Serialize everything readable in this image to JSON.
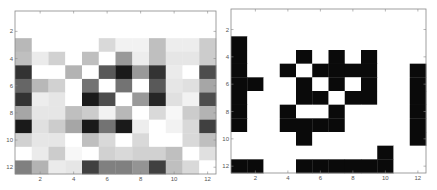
{
  "chart_data": [
    {
      "type": "heatmap",
      "title": "",
      "colormap": "gray",
      "value_meaning": "lightness 0 (black) to 1 (white)",
      "xlabel": "",
      "ylabel": "",
      "xlim": [
        0.5,
        12.5
      ],
      "ylim": [
        0.5,
        12.5
      ],
      "x_ticks": [
        2,
        4,
        6,
        8,
        10,
        12
      ],
      "y_ticks": [
        2,
        4,
        6,
        8,
        10,
        12
      ],
      "y_reversed": true,
      "grid": false,
      "rows": [
        [
          1,
          1,
          1,
          1,
          1,
          1,
          1,
          1,
          1,
          1,
          1,
          1
        ],
        [
          1,
          1,
          1,
          1,
          1,
          1,
          1,
          1,
          1,
          1,
          1,
          1
        ],
        [
          0.72,
          1,
          1,
          1,
          1,
          0.85,
          0.95,
          0.95,
          0.75,
          0.93,
          0.93,
          0.8
        ],
        [
          0.75,
          0.92,
          0.82,
          1,
          0.75,
          1,
          0.6,
          0.93,
          0.75,
          0.9,
          0.9,
          0.8
        ],
        [
          0.2,
          1,
          1,
          0.7,
          1,
          0.35,
          0.1,
          0.6,
          0.2,
          0.92,
          1,
          0.3
        ],
        [
          0.4,
          0.72,
          0.82,
          1,
          0.45,
          1,
          0.45,
          1,
          0.35,
          0.9,
          0.88,
          0.65
        ],
        [
          0.2,
          0.93,
          0.9,
          1,
          0.1,
          0.3,
          1,
          0.6,
          0.15,
          0.88,
          0.95,
          0.3
        ],
        [
          0.65,
          0.9,
          0.9,
          0.75,
          0.8,
          0.95,
          0.72,
          1,
          0.85,
          0.97,
          0.8,
          0.7
        ],
        [
          0.1,
          0.88,
          0.8,
          0.65,
          0.1,
          0.45,
          0.1,
          0.93,
          1,
          0.95,
          0.85,
          0.25
        ],
        [
          0.82,
          0.9,
          0.9,
          1,
          0.75,
          0.85,
          1,
          0.85,
          1,
          1,
          0.85,
          0.75
        ],
        [
          1,
          0.92,
          0.8,
          0.97,
          1,
          0.82,
          0.85,
          0.82,
          0.82,
          0.75,
          1,
          0.88
        ],
        [
          0.5,
          0.7,
          0.92,
          0.9,
          0.25,
          0.5,
          0.5,
          0.58,
          0.25,
          0.75,
          0.85,
          1
        ]
      ]
    },
    {
      "type": "heatmap",
      "title": "",
      "colormap": "binary",
      "value_meaning": "1 = black cell, 0 = white cell",
      "xlabel": "",
      "ylabel": "",
      "xlim": [
        0.5,
        12.5
      ],
      "ylim": [
        0.5,
        12.5
      ],
      "x_ticks": [
        2,
        4,
        6,
        8,
        10,
        12
      ],
      "y_ticks": [
        2,
        4,
        6,
        8,
        10,
        12
      ],
      "y_reversed": true,
      "grid": false,
      "rows": [
        [
          0,
          0,
          0,
          0,
          0,
          0,
          0,
          0,
          0,
          0,
          0,
          0
        ],
        [
          0,
          0,
          0,
          0,
          0,
          0,
          0,
          0,
          0,
          0,
          0,
          0
        ],
        [
          1,
          0,
          0,
          0,
          0,
          0,
          0,
          0,
          0,
          0,
          0,
          0
        ],
        [
          1,
          0,
          0,
          0,
          1,
          0,
          1,
          0,
          1,
          0,
          0,
          0
        ],
        [
          1,
          0,
          0,
          1,
          0,
          1,
          1,
          1,
          1,
          0,
          0,
          1
        ],
        [
          1,
          1,
          0,
          0,
          1,
          0,
          1,
          0,
          1,
          0,
          0,
          1
        ],
        [
          1,
          0,
          0,
          0,
          1,
          1,
          0,
          1,
          1,
          0,
          0,
          1
        ],
        [
          1,
          0,
          0,
          1,
          0,
          0,
          1,
          0,
          0,
          0,
          0,
          1
        ],
        [
          1,
          0,
          0,
          1,
          1,
          1,
          1,
          0,
          0,
          0,
          0,
          1
        ],
        [
          0,
          0,
          0,
          0,
          1,
          0,
          0,
          0,
          0,
          0,
          0,
          1
        ],
        [
          0,
          0,
          0,
          0,
          0,
          0,
          0,
          0,
          0,
          1,
          0,
          0
        ],
        [
          1,
          1,
          0,
          0,
          1,
          1,
          1,
          1,
          1,
          1,
          0,
          0
        ]
      ]
    }
  ],
  "panels": [
    {
      "x": 15,
      "y": 11,
      "w": 201,
      "h": 163
    },
    {
      "x": 231,
      "y": 9,
      "w": 195,
      "h": 164
    }
  ],
  "colors": {
    "frame": "#888888",
    "tick": "#888888",
    "black": "#0a0a0a",
    "white": "#ffffff"
  }
}
